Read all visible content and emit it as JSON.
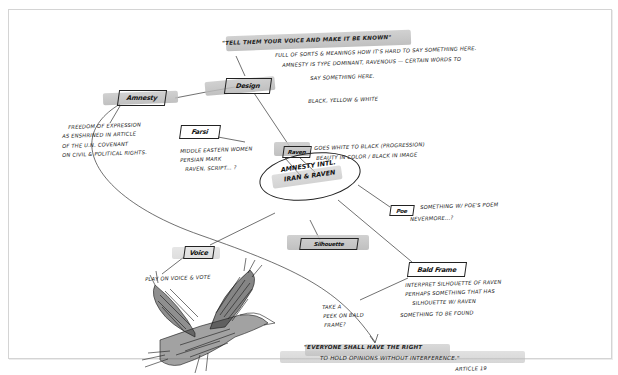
{
  "diagram": {
    "type": "hand-drawn mind map sketch",
    "center_node": {
      "line1": "Amnesty Intl.",
      "line2": "Iran & Raven"
    },
    "quote_top": "\"Tell them your voice and make it be known\"",
    "quote_top_notes": [
      "Full of sorts & meanings how it's hard to say something here.",
      "Amnesty is type dominant, ravenous — certain words to",
      "say something here.",
      "Black, yellow & white"
    ],
    "nodes": [
      {
        "id": "amnesty",
        "label": "Amnesty",
        "notes": [
          "Freedom of expression",
          "as enshrined in article",
          "of the U.N. covenant",
          "on civil & political rights."
        ]
      },
      {
        "id": "design",
        "label": "Design",
        "notes": []
      },
      {
        "id": "farsi",
        "label": "Farsi",
        "notes": [
          "Middle Eastern women",
          "Persian mark",
          "raven, script... ?"
        ]
      },
      {
        "id": "raven",
        "label": "Raven",
        "notes": [
          "Goes white to black (progression)",
          "Beauty in color / black in image"
        ]
      },
      {
        "id": "poe",
        "label": "Poe",
        "notes": [
          "Something w/ Poe's poem",
          "nevermore...?"
        ]
      },
      {
        "id": "voice",
        "label": "Voice",
        "notes": [
          "Play on voice & vote"
        ]
      },
      {
        "id": "silhouette",
        "label": "Silhouette",
        "notes": []
      },
      {
        "id": "bald-frame",
        "label": "Bald Frame",
        "notes": [
          "Interpret silhouette of raven",
          "Perhaps something that has",
          "silhouette w/ raven",
          "Something to be found"
        ]
      }
    ],
    "side_note": [
      "Take a",
      "peek on bald",
      "frame?"
    ],
    "quote_bottom": {
      "line1": "\"Everyone shall have the right",
      "line2": "to hold opinions without interference.\"",
      "attribution": "Article 19"
    },
    "illustration": "raven-in-flight sketch",
    "colors": {
      "ink": "#1a1a1a",
      "marker_gray": "#bdbdbd",
      "paper": "#ffffff",
      "frame_border": "#d4d4d4"
    }
  }
}
